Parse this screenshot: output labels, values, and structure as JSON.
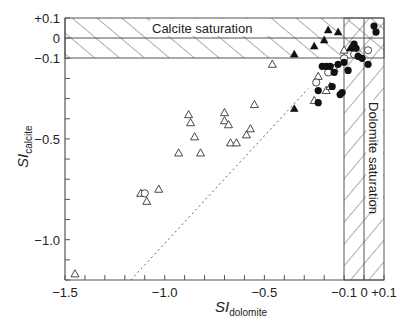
{
  "chart_data": {
    "type": "scatter",
    "title": "",
    "xlabel": "SI",
    "xlabel_sub": "dolomite",
    "ylabel": "SI",
    "ylabel_sub": "calcite",
    "xlim": [
      -1.5,
      0.1
    ],
    "ylim": [
      -1.2,
      0.1
    ],
    "grid": false,
    "x_ticks": [
      {
        "value": -1.5,
        "label": "−1.5"
      },
      {
        "value": -1.0,
        "label": "−1.0"
      },
      {
        "value": -0.5,
        "label": "−0.5"
      },
      {
        "value": -0.1,
        "label": "−0.1"
      },
      {
        "value": 0,
        "label": "0"
      },
      {
        "value": 0.1,
        "label": "+0.1"
      }
    ],
    "y_ticks": [
      {
        "value": 0.1,
        "label": "+0.1"
      },
      {
        "value": 0,
        "label": "0"
      },
      {
        "value": -0.1,
        "label": "−0.1"
      },
      {
        "value": -0.5,
        "label": "−0.5"
      },
      {
        "value": -1.0,
        "label": "−1.0"
      }
    ],
    "minor_tick_step": 0.1,
    "annotations": [
      {
        "text": "Calcite saturation",
        "type": "hatched-band-horizontal",
        "y_range": [
          -0.1,
          0.1
        ]
      },
      {
        "text": "Dolomite saturation",
        "type": "hatched-band-vertical",
        "x_range": [
          -0.1,
          0.1
        ]
      }
    ],
    "reference_line": {
      "style": "dotted",
      "from": [
        -1.17,
        -1.2
      ],
      "to": [
        -0.28,
        -0.25
      ],
      "description": "1:1 relation line"
    },
    "series": [
      {
        "name": "open triangles",
        "marker": "triangle-open",
        "points": [
          [
            -1.45,
            -1.17
          ],
          [
            -1.12,
            -0.77
          ],
          [
            -1.09,
            -0.81
          ],
          [
            -1.03,
            -0.75
          ],
          [
            -0.93,
            -0.57
          ],
          [
            -0.88,
            -0.38
          ],
          [
            -0.87,
            -0.42
          ],
          [
            -0.85,
            -0.49
          ],
          [
            -0.82,
            -0.57
          ],
          [
            -0.7,
            -0.37
          ],
          [
            -0.7,
            -0.41
          ],
          [
            -0.68,
            -0.43
          ],
          [
            -0.67,
            -0.52
          ],
          [
            -0.64,
            -0.52
          ],
          [
            -0.59,
            -0.48
          ],
          [
            -0.57,
            -0.45
          ],
          [
            -0.55,
            -0.33
          ],
          [
            -0.46,
            -0.13
          ],
          [
            -0.25,
            -0.31
          ],
          [
            -0.23,
            -0.19
          ],
          [
            -0.19,
            -0.26
          ],
          [
            -0.17,
            -0.24
          ],
          [
            -0.15,
            -0.15
          ],
          [
            -0.1,
            -0.06
          ]
        ]
      },
      {
        "name": "open circles",
        "marker": "circle-open",
        "points": [
          [
            -1.1,
            -0.77
          ],
          [
            -0.24,
            -0.22
          ],
          [
            -0.18,
            -0.17
          ],
          [
            -0.1,
            -0.1
          ],
          [
            -0.05,
            -0.08
          ],
          [
            0.02,
            -0.06
          ]
        ]
      },
      {
        "name": "filled triangles",
        "marker": "triangle-filled",
        "points": [
          [
            -0.35,
            -0.35
          ],
          [
            -0.35,
            -0.08
          ],
          [
            -0.25,
            -0.04
          ],
          [
            -0.2,
            -0.01
          ],
          [
            -0.18,
            0.04
          ],
          [
            -0.13,
            0.03
          ],
          [
            -0.07,
            -0.05
          ],
          [
            -0.05,
            -0.04
          ]
        ]
      },
      {
        "name": "filled circles",
        "marker": "circle-filled",
        "points": [
          [
            -0.23,
            -0.26
          ],
          [
            -0.23,
            -0.32
          ],
          [
            -0.21,
            -0.14
          ],
          [
            -0.19,
            -0.14
          ],
          [
            -0.17,
            -0.14
          ],
          [
            -0.16,
            -0.24
          ],
          [
            -0.15,
            -0.17
          ],
          [
            -0.13,
            -0.13
          ],
          [
            -0.12,
            -0.28
          ],
          [
            -0.11,
            -0.27
          ],
          [
            -0.1,
            -0.12
          ],
          [
            -0.08,
            -0.16
          ],
          [
            -0.05,
            -0.03
          ],
          [
            -0.04,
            -0.05
          ],
          [
            -0.03,
            -0.09
          ],
          [
            -0.01,
            -0.1
          ],
          [
            0.02,
            -0.13
          ],
          [
            0.05,
            0.06
          ],
          [
            0.06,
            0.03
          ]
        ]
      }
    ]
  },
  "labels": {
    "calcite_band": "Calcite saturation",
    "dolomite_band": "Dolomite saturation",
    "x_axis_main": "SI",
    "x_axis_sub": "dolomite",
    "y_axis_main": "SI",
    "y_axis_sub": "calcite"
  }
}
